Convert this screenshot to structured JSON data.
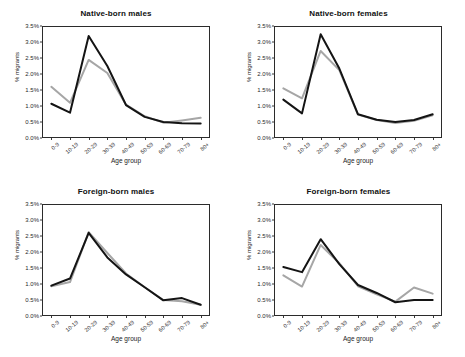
{
  "figure": {
    "panel_order": [
      "native_born_males",
      "native_born_females",
      "foreign_born_males",
      "foreign_born_females"
    ],
    "axis_label_x": "Age group",
    "axis_label_y": "% migrants",
    "colors": {
      "series_1": "#141414",
      "series_2": "#a6a6a6",
      "axis": "#2b2b2b",
      "background": "#ffffff"
    }
  },
  "chart_data": [
    {
      "type": "line",
      "title": "Native-born males",
      "xlabel": "Age group",
      "ylabel": "% migrants",
      "categories": [
        "0-9",
        "10-19",
        "20-29",
        "30-39",
        "40-49",
        "50-59",
        "60-69",
        "70-79",
        "80+"
      ],
      "ylim": [
        0,
        3.5
      ],
      "yticks": [
        "0.0%",
        "0.5%",
        "1.0%",
        "1.5%",
        "2.0%",
        "2.5%",
        "3.0%",
        "3.5%"
      ],
      "ytick_values": [
        0.0,
        0.5,
        1.0,
        1.5,
        2.0,
        2.5,
        3.0,
        3.5
      ],
      "grid": false,
      "legend": "none",
      "series": [
        {
          "name": "series-black",
          "color": "#141414",
          "values": [
            1.07,
            0.79,
            3.19,
            2.25,
            1.03,
            0.66,
            0.5,
            0.46,
            0.45
          ]
        },
        {
          "name": "series-gray",
          "color": "#a6a6a6",
          "values": [
            1.6,
            1.1,
            2.44,
            2.03,
            1.04,
            0.68,
            0.48,
            0.55,
            0.63
          ]
        }
      ]
    },
    {
      "type": "line",
      "title": "Native-born females",
      "xlabel": "Age group",
      "ylabel": "% migrants",
      "categories": [
        "0-9",
        "10-19",
        "20-29",
        "30-39",
        "40-49",
        "50-59",
        "60-69",
        "70-79",
        "80+"
      ],
      "ylim": [
        0,
        3.5
      ],
      "yticks": [
        "0.0%",
        "0.5%",
        "1.0%",
        "1.5%",
        "2.0%",
        "2.5%",
        "3.0%",
        "3.5%"
      ],
      "ytick_values": [
        0.0,
        0.5,
        1.0,
        1.5,
        2.0,
        2.5,
        3.0,
        3.5
      ],
      "grid": false,
      "legend": "none",
      "series": [
        {
          "name": "series-black",
          "color": "#141414",
          "values": [
            1.2,
            0.77,
            3.24,
            2.17,
            0.74,
            0.57,
            0.5,
            0.56,
            0.74
          ]
        },
        {
          "name": "series-gray",
          "color": "#a6a6a6",
          "values": [
            1.55,
            1.24,
            2.72,
            2.12,
            0.73,
            0.56,
            0.47,
            0.54,
            0.71
          ]
        }
      ]
    },
    {
      "type": "line",
      "title": "Foreign-born males",
      "xlabel": "Age group",
      "ylabel": "% migrants",
      "categories": [
        "0-9",
        "10-19",
        "20-29",
        "30-39",
        "40-49",
        "50-59",
        "60-69",
        "70-79",
        "80+"
      ],
      "ylim": [
        0,
        3.5
      ],
      "yticks": [
        "0.0%",
        "0.5%",
        "1.0%",
        "1.5%",
        "2.0%",
        "2.5%",
        "3.0%",
        "3.5%"
      ],
      "ytick_values": [
        0.0,
        0.5,
        1.0,
        1.5,
        2.0,
        2.5,
        3.0,
        3.5
      ],
      "grid": false,
      "legend": "none",
      "series": [
        {
          "name": "series-black",
          "color": "#141414",
          "values": [
            0.95,
            1.17,
            2.6,
            1.83,
            1.3,
            0.9,
            0.49,
            0.56,
            0.35
          ]
        },
        {
          "name": "series-gray",
          "color": "#a6a6a6",
          "values": [
            0.93,
            1.06,
            2.62,
            1.97,
            1.33,
            0.9,
            0.5,
            0.46,
            0.35
          ]
        }
      ]
    },
    {
      "type": "line",
      "title": "Foreign-born females",
      "xlabel": "Age group",
      "ylabel": "% migrants",
      "categories": [
        "0-9",
        "10-19",
        "20-29",
        "30-39",
        "40-49",
        "50-59",
        "60-69",
        "70-79",
        "80+"
      ],
      "ylim": [
        0,
        3.5
      ],
      "yticks": [
        "0.0%",
        "0.5%",
        "1.0%",
        "1.5%",
        "2.0%",
        "2.5%",
        "3.0%",
        "3.5%"
      ],
      "ytick_values": [
        0.0,
        0.5,
        1.0,
        1.5,
        2.0,
        2.5,
        3.0,
        3.5
      ],
      "grid": false,
      "legend": "none",
      "series": [
        {
          "name": "series-black",
          "color": "#141414",
          "values": [
            1.53,
            1.37,
            2.4,
            1.62,
            0.97,
            0.72,
            0.43,
            0.5,
            0.5
          ]
        },
        {
          "name": "series-gray",
          "color": "#a6a6a6",
          "values": [
            1.27,
            0.92,
            2.22,
            1.65,
            0.93,
            0.68,
            0.45,
            0.89,
            0.7
          ]
        }
      ]
    }
  ]
}
